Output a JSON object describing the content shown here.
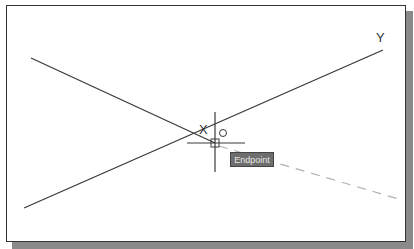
{
  "drawing": {
    "point_labels": {
      "x": "X",
      "y": "Y"
    },
    "snap_tooltip": "Endpoint",
    "colors": {
      "line": "#3a3a3a",
      "rubberband": "#b0b0b0",
      "tooltip_bg": "#6e6e6e"
    }
  }
}
